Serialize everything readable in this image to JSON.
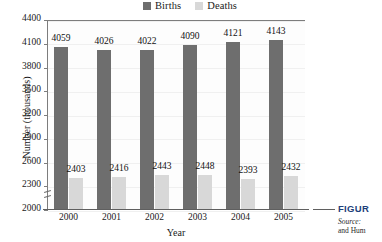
{
  "chart_data": {
    "type": "bar",
    "title": "",
    "xlabel": "Year",
    "ylabel": "Number (thousands)",
    "categories": [
      "2000",
      "2001",
      "2002",
      "2003",
      "2004",
      "2005"
    ],
    "series": [
      {
        "name": "Births",
        "color": "#6e6e6e",
        "values": [
          4059,
          4026,
          4022,
          4090,
          4121,
          4143
        ]
      },
      {
        "name": "Deaths",
        "color": "#d8d8d8",
        "values": [
          2403,
          2416,
          2443,
          2448,
          2393,
          2432
        ]
      }
    ],
    "ylim": [
      2000,
      4400
    ],
    "ytick_step": 300,
    "yticks": [
      4400,
      4100,
      3800,
      3500,
      3200,
      2900,
      2600,
      2300,
      2000
    ],
    "axis_break": true,
    "grid": false,
    "legend_position": "top-center",
    "data_labels": true
  },
  "legend": {
    "entries": [
      {
        "label": "Births",
        "color": "#6e6e6e"
      },
      {
        "label": "Deaths",
        "color": "#d8d8d8"
      }
    ]
  },
  "caption": {
    "figure_label": "FIGUR",
    "source_lead": "Source:",
    "source_line1": "",
    "source_line2": "and Hum"
  }
}
